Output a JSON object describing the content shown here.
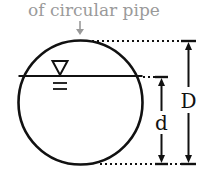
{
  "diagram": {
    "caption": "of circular pipe",
    "labels": {
      "depth": "d",
      "diameter": "D"
    },
    "symbols": {
      "water_surface": "inverted-triangle water surface marker"
    },
    "colors": {
      "stroke": "#111111",
      "caption": "#9a9a9a"
    }
  }
}
